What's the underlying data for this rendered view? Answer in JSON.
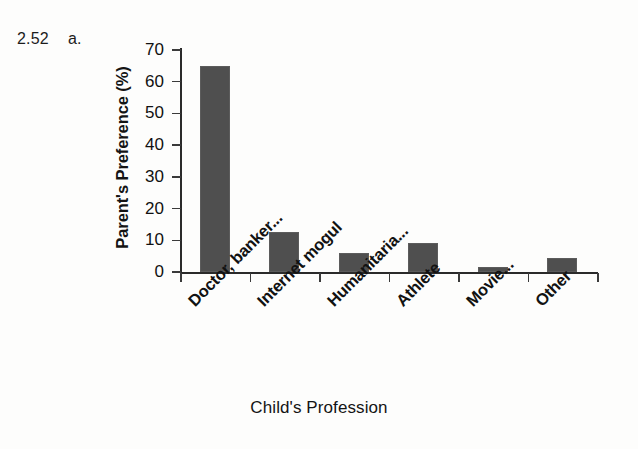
{
  "exercise": {
    "number": "2.52",
    "part": "a."
  },
  "chart_data": {
    "type": "bar",
    "title": "",
    "xlabel": "Child's Profession",
    "ylabel": "Parent's Preference (%)",
    "categories": [
      "Doctor, banker...",
      "Internet mogul",
      "Humanitaria...",
      "Athlete",
      "Movie...",
      "Other"
    ],
    "values": [
      65,
      12.5,
      6,
      9,
      1.5,
      4.5
    ],
    "ylim": [
      0,
      70
    ],
    "ytick_labels": [
      "70",
      "60",
      "50",
      "40",
      "30",
      "20",
      "10",
      "0"
    ],
    "ytick_values": [
      70,
      60,
      50,
      40,
      30,
      20,
      10,
      0
    ],
    "ytick_step": 10,
    "grid": false,
    "legend": "none",
    "bar_color": "#4f4f4f",
    "axis_color": "#2a2a2a",
    "background_color": "#fdfdfc",
    "xtick_label_rotation_deg": -45
  }
}
